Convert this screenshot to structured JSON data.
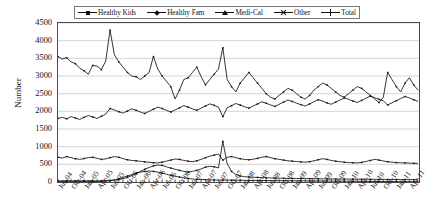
{
  "chart_data": {
    "type": "line",
    "title": "",
    "xlabel": "",
    "ylabel": "Number",
    "ylim": [
      0,
      4500
    ],
    "ytick_step": 500,
    "yticks": [
      "0",
      "500",
      "1000",
      "1500",
      "2000",
      "2500",
      "3000",
      "3500",
      "4000",
      "4500"
    ],
    "grid": true,
    "legend_position": "top",
    "x_tick_labels": [
      "Jul-04",
      "Oct-04",
      "Jan-05",
      "Apr-05",
      "Jul-05",
      "Oct-05",
      "Jan-06",
      "Apr-06",
      "Jul-06",
      "Oct-06",
      "Jan-07",
      "Apr-07",
      "Jul-07",
      "Oct-07",
      "Jan-08",
      "Apr-08",
      "Jul-08",
      "Oct-08",
      "Jan-09",
      "Apr-09",
      "Jul-09",
      "Oct-09",
      "Jan-10",
      "Apr-10",
      "Jul-10",
      "Oct-10",
      "Jan-11",
      "Apr-11"
    ],
    "x_tick_interval_months": 3,
    "x_start": "Jul-04",
    "x_end": "Jun-11",
    "n_points": 84,
    "series": [
      {
        "name": "Healthy Kids",
        "marker": "dash",
        "values": [
          30,
          25,
          35,
          28,
          32,
          26,
          30,
          34,
          28,
          25,
          30,
          36,
          40,
          55,
          70,
          95,
          130,
          180,
          235,
          300,
          360,
          410,
          455,
          480,
          470,
          430,
          395,
          360,
          330,
          300,
          285,
          300,
          330,
          370,
          420,
          445,
          430,
          400,
          1150,
          520,
          300,
          210,
          170,
          150,
          140,
          135,
          130,
          125,
          120,
          115,
          110,
          108,
          106,
          104,
          102,
          100,
          98,
          96,
          95,
          94,
          92,
          90,
          88,
          86,
          85,
          84,
          83,
          82,
          80,
          79,
          78,
          77,
          76,
          75,
          74,
          73,
          72,
          71,
          70,
          69,
          68,
          67,
          66,
          65
        ]
      },
      {
        "name": "Healthy Fam",
        "marker": "diamond",
        "values": [
          700,
          680,
          720,
          690,
          660,
          640,
          665,
          690,
          700,
          670,
          640,
          655,
          690,
          720,
          700,
          660,
          630,
          610,
          600,
          585,
          570,
          560,
          545,
          540,
          560,
          590,
          620,
          650,
          640,
          610,
          590,
          575,
          600,
          640,
          690,
          730,
          760,
          790,
          620,
          700,
          720,
          690,
          660,
          640,
          630,
          645,
          670,
          700,
          720,
          690,
          660,
          640,
          620,
          600,
          590,
          580,
          570,
          560,
          575,
          600,
          630,
          660,
          640,
          610,
          590,
          575,
          560,
          550,
          545,
          540,
          555,
          580,
          610,
          640,
          620,
          595,
          575,
          560,
          550,
          545,
          540,
          535,
          530,
          525
        ]
      },
      {
        "name": "Medi-Cal",
        "marker": "triangle",
        "values": [
          1800,
          1830,
          1790,
          1850,
          1810,
          1770,
          1830,
          1880,
          1840,
          1800,
          1860,
          1920,
          2080,
          2040,
          1990,
          1950,
          2010,
          2070,
          2030,
          1980,
          1940,
          2000,
          2060,
          2120,
          2080,
          2030,
          1980,
          2040,
          2100,
          2160,
          2120,
          2070,
          2030,
          2090,
          2150,
          2210,
          2170,
          2120,
          1850,
          2100,
          2160,
          2220,
          2180,
          2130,
          2090,
          2150,
          2210,
          2270,
          2230,
          2180,
          2140,
          2200,
          2260,
          2320,
          2280,
          2230,
          2190,
          2150,
          2210,
          2270,
          2330,
          2290,
          2240,
          2200,
          2260,
          2320,
          2380,
          2340,
          2290,
          2250,
          2310,
          2370,
          2430,
          2390,
          2340,
          2300,
          2180,
          2240,
          2300,
          2360,
          2420,
          2380,
          2330,
          2280
        ]
      },
      {
        "name": "Other",
        "marker": "x",
        "values": [
          20,
          18,
          22,
          20,
          19,
          21,
          23,
          20,
          18,
          22,
          25,
          28,
          40,
          60,
          90,
          130,
          170,
          210,
          250,
          280,
          300,
          310,
          300,
          280,
          250,
          220,
          190,
          160,
          140,
          120,
          100,
          85,
          75,
          70,
          65,
          60,
          58,
          56,
          55,
          54,
          52,
          50,
          48,
          46,
          45,
          44,
          43,
          42,
          41,
          40,
          39,
          38,
          37,
          36,
          35,
          34,
          33,
          32,
          31,
          30,
          29,
          28,
          27,
          26,
          25,
          24,
          23,
          22,
          21,
          20,
          19,
          18,
          17,
          16,
          15,
          14,
          13,
          12,
          11,
          10,
          9,
          8,
          7,
          6
        ]
      },
      {
        "name": "Total",
        "marker": "star",
        "values": [
          3550,
          3480,
          3520,
          3400,
          3350,
          3220,
          3150,
          3050,
          3300,
          3280,
          3180,
          3420,
          4300,
          3600,
          3400,
          3250,
          3100,
          3000,
          2980,
          2900,
          3000,
          3100,
          3550,
          3200,
          3000,
          2850,
          2700,
          2350,
          2600,
          2900,
          2950,
          3100,
          3250,
          2980,
          2750,
          2900,
          3050,
          3200,
          3800,
          2900,
          2700,
          2550,
          2800,
          2950,
          3100,
          2950,
          2800,
          2650,
          2500,
          2400,
          2350,
          2450,
          2550,
          2650,
          2600,
          2500,
          2400,
          2350,
          2450,
          2600,
          2700,
          2800,
          2750,
          2650,
          2550,
          2450,
          2400,
          2500,
          2600,
          2700,
          2650,
          2550,
          2450,
          2350,
          2250,
          2400,
          3100,
          2900,
          2700,
          2550,
          2800,
          2950,
          2750,
          2600
        ]
      }
    ]
  },
  "legend": {
    "items": [
      {
        "label": "Healthy Kids",
        "marker": "dash"
      },
      {
        "label": "Healthy Fam",
        "marker": "diamond"
      },
      {
        "label": "Medi-Cal",
        "marker": "triangle"
      },
      {
        "label": "Other",
        "marker": "x"
      },
      {
        "label": "Total",
        "marker": "star"
      }
    ]
  },
  "colors": {
    "line": "#111111",
    "grid": "#b9b9b9",
    "axis": "#4a4a4a"
  }
}
